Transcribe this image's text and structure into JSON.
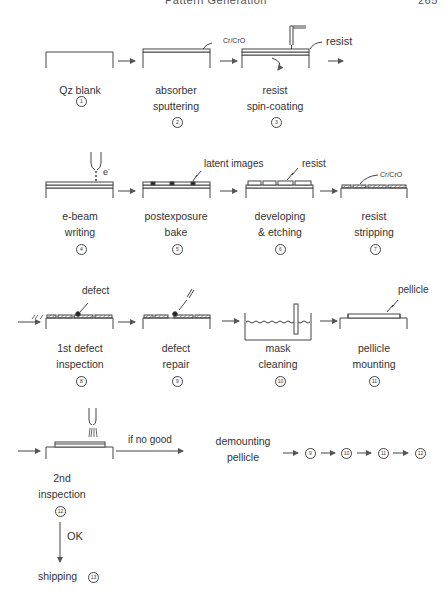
{
  "header": {
    "running_title": "Pattern Generation",
    "page_number": "265"
  },
  "steps": [
    {
      "number": "1",
      "label_line1": "Qz blank",
      "label_line2": ""
    },
    {
      "number": "2",
      "label_line1": "absorber",
      "label_line2": "sputtering"
    },
    {
      "number": "3",
      "label_line1": "resist",
      "label_line2": "spin-coating"
    },
    {
      "number": "4",
      "label_line1": "e-beam",
      "label_line2": "writing"
    },
    {
      "number": "5",
      "label_line1": "postexposure",
      "label_line2": "bake"
    },
    {
      "number": "6",
      "label_line1": "developing",
      "label_line2": "& etching"
    },
    {
      "number": "7",
      "label_line1": "resist",
      "label_line2": "stripping"
    },
    {
      "number": "8",
      "label_line1": "1st defect",
      "label_line2": "inspection"
    },
    {
      "number": "9",
      "label_line1": "defect",
      "label_line2": "repair"
    },
    {
      "number": "10",
      "label_line1": "mask",
      "label_line2": "cleaning"
    },
    {
      "number": "11",
      "label_line1": "pellicle",
      "label_line2": "mounting"
    },
    {
      "number": "12",
      "label_line1": "2nd",
      "label_line2": "inspection"
    },
    {
      "number": "13",
      "label_line1": "shipping",
      "label_line2": ""
    }
  ],
  "annotations": {
    "cr_cro_1": "Cr/CrO",
    "resist_1": "resist",
    "electron": "e",
    "electron_sup": "-",
    "latent_images": "latent images",
    "resist_2": "resist",
    "cr_cro_2": "Cr/CrO",
    "defect": "defect",
    "pellicle": "pellicle",
    "if_no_good": "if no good",
    "demounting_line1": "demounting",
    "demounting_line2": "pellicle",
    "ok": "OK"
  },
  "rework_loop": [
    "9",
    "10",
    "11",
    "12"
  ]
}
